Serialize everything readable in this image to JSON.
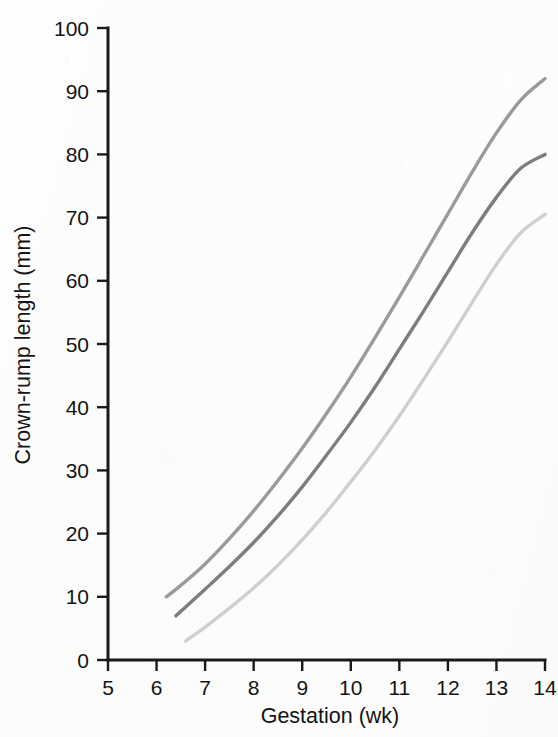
{
  "figure": {
    "background_color": "#fdfdfc",
    "axis_color": "#1a1a1a"
  },
  "chart_data": {
    "type": "line",
    "title": "",
    "subtitle": "",
    "xlabel": "Gestation (wk)",
    "ylabel": "Crown-rump length (mm)",
    "xlim": [
      5,
      14
    ],
    "ylim": [
      0,
      100
    ],
    "xticks": [
      5,
      6,
      7,
      8,
      9,
      10,
      11,
      12,
      13,
      14
    ],
    "yticks": [
      0,
      10,
      20,
      30,
      40,
      50,
      60,
      70,
      80,
      90,
      100
    ],
    "xtick_labels": [
      "5",
      "6",
      "7",
      "8",
      "9",
      "10",
      "11",
      "12",
      "13",
      "14"
    ],
    "ytick_labels": [
      "0",
      "10",
      "20",
      "30",
      "40",
      "50",
      "60",
      "70",
      "80",
      "90",
      "100"
    ],
    "grid": false,
    "legend": "none",
    "annotations": [],
    "x": [
      6.2,
      6.4,
      6.6,
      7,
      7.5,
      8,
      8.5,
      9,
      9.5,
      10,
      10.5,
      11,
      11.5,
      12,
      12.5,
      13,
      13.5,
      14
    ],
    "series": [
      {
        "name": "upper-percentile",
        "color": "#9a9a9a",
        "x": [
          6.2,
          6.5,
          7,
          7.5,
          8,
          8.5,
          9,
          9.5,
          10,
          10.5,
          11,
          11.5,
          12,
          12.5,
          13,
          13.5,
          14
        ],
        "values": [
          10,
          11.8,
          15.2,
          19.2,
          23.6,
          28.4,
          33.5,
          39.0,
          44.8,
          51.0,
          57.4,
          64.0,
          70.6,
          77.2,
          83.4,
          88.6,
          92.0
        ]
      },
      {
        "name": "median-percentile",
        "color": "#7d7d7d",
        "x": [
          6.4,
          6.6,
          7,
          7.5,
          8,
          8.5,
          9,
          9.5,
          10,
          10.5,
          11,
          11.5,
          12,
          12.5,
          13,
          13.5,
          14
        ],
        "values": [
          7,
          8.4,
          11.2,
          14.8,
          18.6,
          22.8,
          27.4,
          32.4,
          37.6,
          43.2,
          49.2,
          55.2,
          61.4,
          67.6,
          73.2,
          77.8,
          80.0
        ]
      },
      {
        "name": "lower-percentile",
        "color": "#cfcfcf",
        "x": [
          6.6,
          7,
          7.5,
          8,
          8.5,
          9,
          9.5,
          10,
          10.5,
          11,
          11.5,
          12,
          12.5,
          13,
          13.5,
          14
        ],
        "values": [
          3,
          5.2,
          8.2,
          11.4,
          15.0,
          19.0,
          23.4,
          28.2,
          33.2,
          38.6,
          44.4,
          50.4,
          56.6,
          62.6,
          67.6,
          70.5
        ]
      }
    ]
  }
}
